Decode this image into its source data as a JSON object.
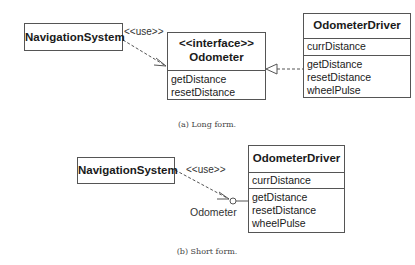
{
  "long_form": {
    "nav_system": {
      "name": "NavigationSystem"
    },
    "use_label": "<<use>>",
    "interface": {
      "stereotype": "<<interface>>",
      "name": "Odometer",
      "operations": [
        "getDistance",
        "resetDistance"
      ]
    },
    "driver": {
      "name": "OdometerDriver",
      "attributes": [
        "currDistance"
      ],
      "operations": [
        "getDistance",
        "resetDistance",
        "wheelPulse"
      ]
    },
    "caption": "(a) Long form."
  },
  "short_form": {
    "nav_system": {
      "name": "NavigationSystem"
    },
    "use_label": "<<use>>",
    "interface_label": "Odometer",
    "driver": {
      "name": "OdometerDriver",
      "attributes": [
        "currDistance"
      ],
      "operations": [
        "getDistance",
        "resetDistance",
        "wheelPulse"
      ]
    },
    "caption": "(b) Short form."
  }
}
